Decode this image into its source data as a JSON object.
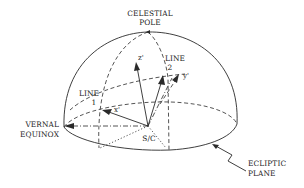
{
  "labels": {
    "celestial_pole": [
      "CELESTIAL",
      "POLE"
    ],
    "line1": [
      "LINE",
      "1"
    ],
    "line2": [
      "LINE",
      "2"
    ],
    "vernal_equinox": [
      "VERNAL",
      "EQUINOX"
    ],
    "ecliptic_plane": [
      "ECLIPTIC",
      "PLANE"
    ],
    "spacecraft": "S/C",
    "x_axis": "x'",
    "y_axis": "y'",
    "z_axis": "z'"
  },
  "colors": {
    "stroke": "#2a2a2a",
    "background": "#ffffff"
  }
}
